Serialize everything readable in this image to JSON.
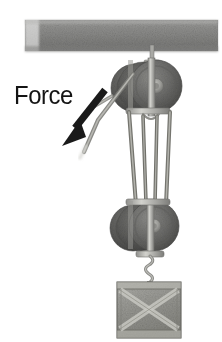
{
  "figure": {
    "background_color": "#ffffff",
    "annotation": {
      "force_label": "Force",
      "force_label_color": "#141414",
      "arrow_color": "#1a1a1a",
      "arrow_direction": "down-left"
    },
    "palette": {
      "beam_fill": "#8e8e8c",
      "beam_shadow": "#6f6f6d",
      "sheave_front": "#6e6e6c",
      "sheave_rear": "#5b5b59",
      "sheave_hub": "#a9a9a6",
      "frame_metal": "#b9b9b5",
      "frame_edge": "#767674",
      "rope": "#9a9a95",
      "rope_shadow": "#6d6d69",
      "crate_fill": "#9d9d98",
      "crate_brace": "#c3c3bd",
      "crate_edge": "#6a6a66",
      "hook_metal": "#8a8a86"
    },
    "parts": [
      {
        "name": "ceiling-beam",
        "label": "Ceiling beam",
        "x": 25,
        "y": 20,
        "width": 193,
        "height": 31,
        "texture": "speckled-gray"
      },
      {
        "name": "top-hanger",
        "label": "Top hanger bolt",
        "x": 147,
        "y": 48,
        "width": 11,
        "height": 17
      },
      {
        "name": "upper-pulley-block",
        "label": "Upper fixed double block",
        "center_x": 153,
        "center_y": 86,
        "sheave_radius": 26,
        "sheave_count": 2,
        "rear_offset_x": -16
      },
      {
        "name": "lower-pulley-block",
        "label": "Lower movable double block",
        "center_x": 152,
        "center_y": 226,
        "sheave_radius": 25,
        "sheave_count": 2,
        "rear_offset_x": -16
      },
      {
        "name": "rope-strands",
        "label": "Rope strands between blocks",
        "strand_count": 4,
        "top_y": 112,
        "bottom_y": 205
      },
      {
        "name": "free-rope-end",
        "label": "Free rope end pulled by force",
        "from_x": 132,
        "from_y": 86,
        "to_x": 82,
        "to_y": 158
      },
      {
        "name": "load-hook",
        "label": "Twisted hook link",
        "x": 146,
        "y": 254,
        "height": 28
      },
      {
        "name": "crate-load",
        "label": "Crate load",
        "x": 117,
        "y": 282,
        "width": 64,
        "height": 56,
        "brace": "x-cross"
      }
    ]
  }
}
